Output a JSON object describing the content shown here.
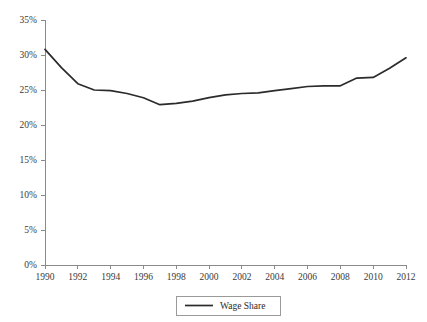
{
  "chart_data": {
    "type": "line",
    "title": "",
    "xlabel": "",
    "ylabel": "",
    "grid": false,
    "legend_position": "bottom-center",
    "xlim": [
      1990,
      2012
    ],
    "ylim": [
      0,
      35
    ],
    "y_tick_labels": [
      "0%",
      "5%",
      "10%",
      "15%",
      "20%",
      "25%",
      "30%",
      "35%"
    ],
    "y_tick_values": [
      0,
      5,
      10,
      15,
      20,
      25,
      30,
      35
    ],
    "x_tick_labels": [
      "1990",
      "1992",
      "1994",
      "1996",
      "1998",
      "2000",
      "2002",
      "2004",
      "2006",
      "2008",
      "2010",
      "2012"
    ],
    "x_tick_values": [
      1990,
      1992,
      1994,
      1996,
      1998,
      2000,
      2002,
      2004,
      2006,
      2008,
      2010,
      2012
    ],
    "x": [
      1990,
      1991,
      1992,
      1993,
      1994,
      1995,
      1996,
      1997,
      1998,
      1999,
      2000,
      2001,
      2002,
      2003,
      2004,
      2005,
      2006,
      2007,
      2008,
      2009,
      2010,
      2011,
      2012
    ],
    "series": [
      {
        "name": "Wage Share",
        "color": "#2b2b2b",
        "values": [
          30.8,
          28.2,
          25.9,
          25.0,
          24.9,
          24.5,
          23.9,
          22.9,
          23.1,
          23.4,
          23.9,
          24.3,
          24.5,
          24.6,
          24.9,
          25.2,
          25.5,
          25.6,
          25.6,
          26.7,
          26.8,
          28.1,
          29.6
        ]
      }
    ]
  },
  "legend": {
    "entries": [
      {
        "label": "Wage Share"
      }
    ]
  }
}
